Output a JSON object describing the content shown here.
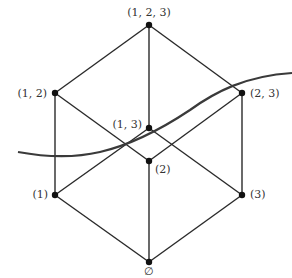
{
  "diagram": {
    "nodes": [
      {
        "id": "n123",
        "label": "(1, 2, 3)"
      },
      {
        "id": "n12",
        "label": "(1, 2)"
      },
      {
        "id": "n23",
        "label": "(2, 3)"
      },
      {
        "id": "n13",
        "label": "(1, 3)"
      },
      {
        "id": "n2",
        "label": "(2)"
      },
      {
        "id": "n1",
        "label": "(1)"
      },
      {
        "id": "n3",
        "label": "(3)"
      },
      {
        "id": "n0",
        "label": "∅"
      }
    ],
    "edges": [
      [
        "n123",
        "n12"
      ],
      [
        "n123",
        "n23"
      ],
      [
        "n123",
        "n13"
      ],
      [
        "n12",
        "n1"
      ],
      [
        "n12",
        "n2"
      ],
      [
        "n23",
        "n2"
      ],
      [
        "n23",
        "n3"
      ],
      [
        "n13",
        "n1"
      ],
      [
        "n13",
        "n3"
      ],
      [
        "n1",
        "n0"
      ],
      [
        "n2",
        "n0"
      ],
      [
        "n3",
        "n0"
      ]
    ],
    "cut_curve": "separating curve"
  }
}
